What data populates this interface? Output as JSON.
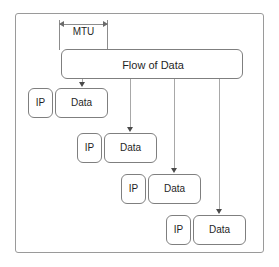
{
  "figure": {
    "frame": {
      "name": "diagram-border"
    }
  },
  "colors": {
    "frame_border": "#9a9a9a",
    "box_border": "#7f7f7f",
    "connector": "#a8a8a8",
    "arrow_head": "#4a4a4a",
    "text": "#1f1f1f",
    "background": "#ffffff"
  },
  "mtu": {
    "label": "MTU",
    "left_tick_x": 59,
    "right_tick_x": 107,
    "span_px": 48
  },
  "flow": {
    "label": "Flow of Data",
    "x": 61,
    "y": 49,
    "width": 182,
    "height": 30
  },
  "packets": [
    {
      "index": 1,
      "ip_label": "IP",
      "data_label": "Data",
      "x": 28,
      "y": 88,
      "arrow_x": 82,
      "arrow_from_y": 79,
      "arrow_to_y": 88
    },
    {
      "index": 2,
      "ip_label": "IP",
      "data_label": "Data",
      "x": 77,
      "y": 133,
      "arrow_x": 130,
      "arrow_from_y": 79,
      "arrow_to_y": 133
    },
    {
      "index": 3,
      "ip_label": "IP",
      "data_label": "Data",
      "x": 121,
      "y": 174,
      "arrow_x": 174,
      "arrow_from_y": 79,
      "arrow_to_y": 174
    },
    {
      "index": 4,
      "ip_label": "IP",
      "data_label": "Data",
      "x": 166,
      "y": 215,
      "arrow_x": 219,
      "arrow_from_y": 79,
      "arrow_to_y": 215
    }
  ]
}
